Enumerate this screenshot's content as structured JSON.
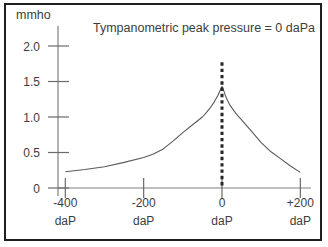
{
  "chart_data": {
    "type": "line",
    "title": "Tympanometric peak pressure = 0 daPa",
    "ylabel": "mmho",
    "x_unit": "daP",
    "x_ticks": [
      {
        "label": "-400",
        "unit": "daP",
        "value": -400
      },
      {
        "label": "-200",
        "unit": "daP",
        "value": -200
      },
      {
        "label": "0",
        "unit": "daP",
        "value": 0
      },
      {
        "label": "+200",
        "unit": "daP",
        "value": 200
      }
    ],
    "y_ticks": [
      {
        "label": "0",
        "value": 0
      },
      {
        "label": "0.5",
        "value": 0.5
      },
      {
        "label": "1.0",
        "value": 1.0
      },
      {
        "label": "1.5",
        "value": 1.5
      },
      {
        "label": "2.0",
        "value": 2.0
      }
    ],
    "xlim": [
      -430,
      230
    ],
    "ylim": [
      0,
      2.3
    ],
    "grid": false,
    "legend": false,
    "series": [
      {
        "name": "tympanogram",
        "points": [
          [
            -400,
            0.23
          ],
          [
            -350,
            0.26
          ],
          [
            -300,
            0.3
          ],
          [
            -250,
            0.36
          ],
          [
            -200,
            0.43
          ],
          [
            -175,
            0.48
          ],
          [
            -150,
            0.55
          ],
          [
            -125,
            0.66
          ],
          [
            -100,
            0.78
          ],
          [
            -75,
            0.89
          ],
          [
            -50,
            1.0
          ],
          [
            -40,
            1.06
          ],
          [
            -30,
            1.13
          ],
          [
            -20,
            1.21
          ],
          [
            -10,
            1.31
          ],
          [
            -5,
            1.37
          ],
          [
            0,
            1.43
          ],
          [
            5,
            1.36
          ],
          [
            10,
            1.28
          ],
          [
            20,
            1.17
          ],
          [
            30,
            1.09
          ],
          [
            40,
            1.02
          ],
          [
            50,
            0.96
          ],
          [
            75,
            0.8
          ],
          [
            100,
            0.64
          ],
          [
            125,
            0.51
          ],
          [
            150,
            0.41
          ],
          [
            175,
            0.31
          ],
          [
            200,
            0.22
          ]
        ]
      }
    ],
    "peak_marker": {
      "x": 0,
      "y_bottom": 0,
      "y_top": 1.77,
      "style": "dotted"
    },
    "peak_pressure_daPa": 0,
    "peak_admittance_mmho": 1.43,
    "colors": {
      "background": "#ffffff",
      "border": "#1f1f1f",
      "axis": "#808080",
      "tick": "#6a6a6a",
      "text": "#3d3d3d",
      "curve": "#5a5a5a",
      "marker": "#262626"
    }
  }
}
